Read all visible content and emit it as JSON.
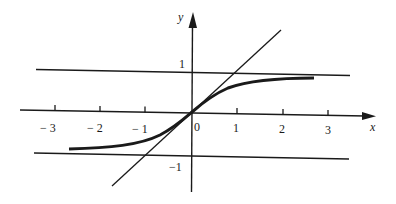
{
  "figure": {
    "axes": {
      "x_label": "x",
      "y_label": "y",
      "x_ticks": [
        "− 3",
        "− 2",
        "− 1",
        "0",
        "1",
        "2",
        "3"
      ],
      "y_ticks": [
        "1",
        "−1"
      ]
    },
    "curves": [
      {
        "name": "tanh-curve",
        "description": "y = tanh x",
        "style": "thick"
      },
      {
        "name": "line-y-equals-x",
        "description": "y = x",
        "style": "thin"
      },
      {
        "name": "asymptote-upper",
        "description": "y = 1",
        "style": "thin"
      },
      {
        "name": "asymptote-lower",
        "description": "y = -1",
        "style": "thin"
      }
    ],
    "colors": {
      "ink": "#1a1a1a",
      "background": "#ffffff"
    }
  }
}
